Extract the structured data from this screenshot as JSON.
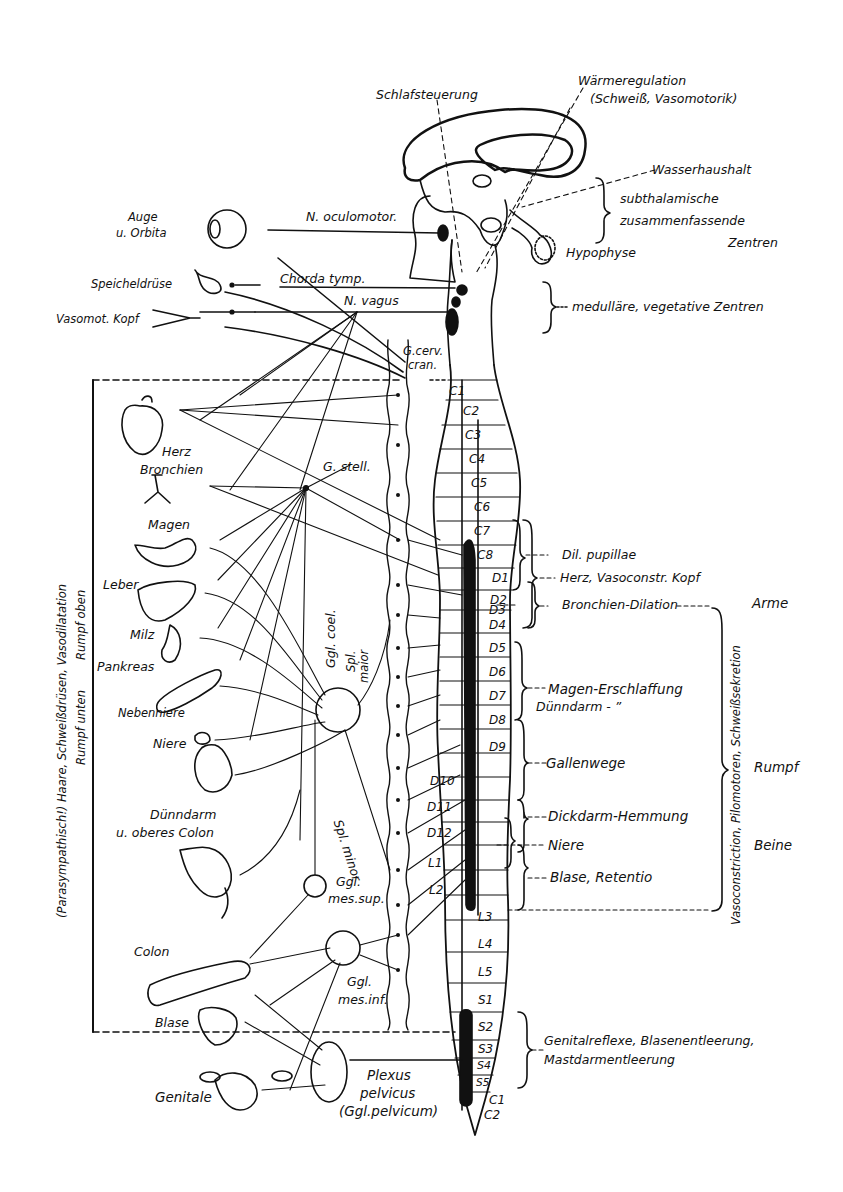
{
  "hypothalamus": {
    "sleep": "Schlafsteuerung",
    "heat_line1": "Wärmeregulation",
    "heat_line2": "(Schweiß, Vasomotorik)",
    "water": "Wasserhaushalt",
    "subthal_line1": "subthalamische",
    "subthal_line2": "zusammenfassende",
    "subthal_line3": "Zentren",
    "hypophysis": "Hypophyse",
    "medulla_centers": "medulläre, vegetative Zentren"
  },
  "cranial": {
    "eye_line1": "Auge",
    "eye_line2": "u. Orbita",
    "oculomotor": "N. oculomotor.",
    "chorda": "Chorda tymp.",
    "vagus": "N. vagus",
    "salivary": "Speicheldrüse",
    "vasomot_head": "Vasomot. Kopf",
    "g_cerv_line1": "G.cerv.",
    "g_cerv_line2": "cran."
  },
  "organs": {
    "heart": "Herz",
    "bronchi": "Bronchien",
    "stomach": "Magen",
    "liver": "Leber",
    "spleen": "Milz",
    "pancreas": "Pankreas",
    "adrenal": "Nebenniere",
    "kidney": "Niere",
    "small_int_line1": "Dünndarm",
    "small_int_line2": "u. oberes Colon",
    "colon": "Colon",
    "bladder": "Blase",
    "genitals": "Genitale"
  },
  "ganglia": {
    "g_stell": "G. stell.",
    "ggl_coel": "Ggl. coel.",
    "spl_maior_line1": "Spl.",
    "spl_maior_line2": "maior",
    "spl_minor": "Spl. minor",
    "ggl_mes_sup_line1": "Ggl.",
    "ggl_mes_sup_line2": "mes.sup.",
    "ggl_mes_inf_line1": "Ggl.",
    "ggl_mes_inf_line2": "mes.inf.",
    "plexus_line1": "Plexus",
    "plexus_line2": "pelvicus",
    "plexus_line3": "(Ggl.pelvicum)"
  },
  "left_side": {
    "vertical_line1": "(Parasympathisch!) Haare, Schweißdrüsen, Vasodilatation",
    "vertical_line2a": "Rumpf oben",
    "vertical_line2b": "Rumpf unten"
  },
  "segments": {
    "cervical": [
      "C1",
      "C2",
      "C3",
      "C4",
      "C5",
      "C6",
      "C7",
      "C8"
    ],
    "dorsal": [
      "D1",
      "D2",
      "D3",
      "D4",
      "D5",
      "D6",
      "D7",
      "D8",
      "D9",
      "D10",
      "D11",
      "D12"
    ],
    "lumbar": [
      "L1",
      "L2",
      "L3",
      "L4",
      "L5"
    ],
    "sacral": [
      "S1",
      "S2",
      "S3",
      "S4",
      "S5"
    ],
    "coccygeal": [
      "C1",
      "C2"
    ]
  },
  "functions": {
    "dil_pupillae": "Dil. pupillae",
    "heart_vasoconstr": "Herz, Vasoconstr. Kopf",
    "bronchial_dilation": "Bronchien-Dilation",
    "stomach_relax": "Magen-Erschlaffung",
    "small_int": "Dünndarm -      ”",
    "bile": "Gallenwege",
    "colon_inhib": "Dickdarm-Hemmung",
    "kidney": "Niere",
    "bladder": "Blase, Retentio",
    "sacral_reflexes_line1": "Genitalreflexe, Blasenentleerung,",
    "sacral_reflexes_line2": "Mastdarmentleerung"
  },
  "right_side": {
    "arms": "Arme",
    "trunk": "Rumpf",
    "legs": "Beine",
    "vertical": "Vasoconstriction, Pilomotoren, Schweißsekretion"
  }
}
